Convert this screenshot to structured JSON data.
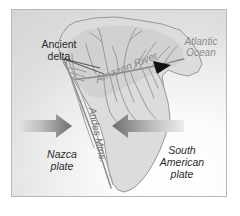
{
  "figure": {
    "kind": "map-diagram",
    "frame_border_color": "#b9b9b9",
    "background_color": "#d6d6d6"
  },
  "labels": {
    "ancient_delta": "Ancient\ndelta",
    "ancient_delta_line1": "Ancient",
    "ancient_delta_line2": "delta",
    "atlantic_ocean_line1": "Atlantic",
    "atlantic_ocean_line2": "Ocean",
    "amazon_river": "Amazon River",
    "andes_mtns": "Andes Mtns.",
    "nazca_plate_line1": "Nazca",
    "nazca_plate_line2": "plate",
    "south_american_plate_line1": "South",
    "south_american_plate_line2": "American",
    "south_american_plate_line3": "plate"
  },
  "colors": {
    "land_fill": "#dcdcdc",
    "basin_fill": "#cfcfcf",
    "coastline": "#8f8f8f",
    "river": "#8a8a8a",
    "arrow_dark": "#6b6b6b",
    "arrow_light": "#d2d2d2",
    "arrowhead_black": "#111111",
    "leader_line": "#333333",
    "text_dark": "#2b2b2b",
    "text_gray": "#8c8c8c"
  },
  "icons": {
    "river_mouth_marker": "black-triangle-arrowhead-icon",
    "nazca_convergence_arrow": "arrow-right-icon",
    "south_american_convergence_arrow": "arrow-left-icon",
    "delta_leader_line": "leader-line-icon"
  }
}
